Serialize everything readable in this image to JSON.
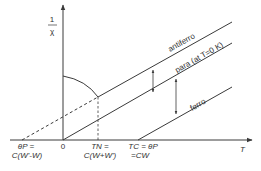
{
  "diagram": {
    "type": "inverse susceptibility vs temperature",
    "y_axis": {
      "label_num": "1",
      "label_den": "χ"
    },
    "x_axis": {
      "label": "T",
      "origin": "0"
    },
    "lines": {
      "antiferro": "antiferro",
      "para": "para (at T=0 K)",
      "ferro": "ferro"
    },
    "x_ticks": {
      "theta_p_line1": "θP =",
      "theta_p_line2": "C(W'-W)",
      "tn_line1": "TN =",
      "tn_line2": "C(W+W')",
      "tc_line1": "TC = θP",
      "tc_line2": "=CW"
    },
    "colors": {
      "line": "#3a3a3a",
      "background": "#ffffff"
    }
  }
}
